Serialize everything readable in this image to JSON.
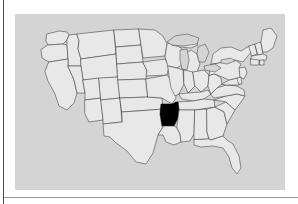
{
  "page": {
    "background_color": "#ffffff",
    "width": 298,
    "height": 204
  },
  "rules": {
    "vertical_rule_color": "#4a4a4a",
    "horizontal_rule_color": "#9a9a9a"
  },
  "map": {
    "title": "",
    "caption": "",
    "plate_background_color": "#d4d4d4",
    "state_fill_color": "#e8e8e8",
    "state_border_color": "#3a3a3a",
    "highlight_color": "#000000",
    "water_color": "#d4d4d4",
    "projection": "united-states-contiguous",
    "highlighted_states": [
      "Arkansas"
    ],
    "states": [
      "Washington",
      "Oregon",
      "California",
      "Nevada",
      "Idaho",
      "Montana",
      "Wyoming",
      "Utah",
      "Arizona",
      "Colorado",
      "New Mexico",
      "North Dakota",
      "South Dakota",
      "Nebraska",
      "Kansas",
      "Oklahoma",
      "Texas",
      "Minnesota",
      "Iowa",
      "Missouri",
      "Arkansas",
      "Louisiana",
      "Wisconsin",
      "Illinois",
      "Michigan",
      "Indiana",
      "Ohio",
      "Kentucky",
      "Tennessee",
      "Mississippi",
      "Alabama",
      "Georgia",
      "Florida",
      "South Carolina",
      "North Carolina",
      "Virginia",
      "West Virginia",
      "Maryland",
      "Delaware",
      "New Jersey",
      "Pennsylvania",
      "New York",
      "Connecticut",
      "Rhode Island",
      "Massachusetts",
      "Vermont",
      "New Hampshire",
      "Maine"
    ],
    "water_features": [
      "Lake Superior",
      "Lake Michigan",
      "Lake Huron",
      "Lake Erie",
      "Lake Ontario"
    ]
  }
}
